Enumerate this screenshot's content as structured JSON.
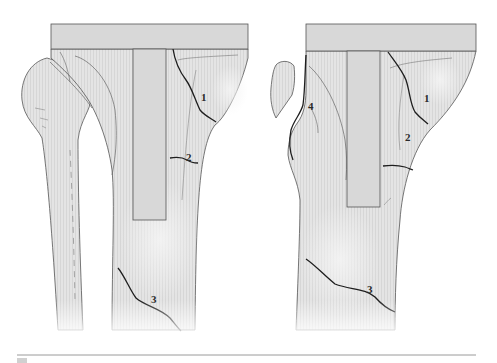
{
  "figure": {
    "colors": {
      "bone_fill": "#e2e2e2",
      "bone_shade": "#cfcfcf",
      "implant_fill": "#d6d6d6",
      "outline": "#444444",
      "fracture_line": "#1e1e1e",
      "rule_line": "#9a9a9a"
    },
    "panels": [
      {
        "name": "left-view",
        "labels": [
          {
            "id": "1",
            "text": "1",
            "x": 201,
            "y": 101
          },
          {
            "id": "2",
            "text": "2",
            "x": 186,
            "y": 161
          },
          {
            "id": "3",
            "text": "3",
            "x": 151,
            "y": 303
          }
        ]
      },
      {
        "name": "right-view",
        "labels": [
          {
            "id": "4",
            "text": "4",
            "x": 308,
            "y": 110
          },
          {
            "id": "1",
            "text": "1",
            "x": 424,
            "y": 102
          },
          {
            "id": "2",
            "text": "2",
            "x": 405,
            "y": 141
          },
          {
            "id": "3",
            "text": "3",
            "x": 367,
            "y": 293
          }
        ]
      }
    ]
  }
}
